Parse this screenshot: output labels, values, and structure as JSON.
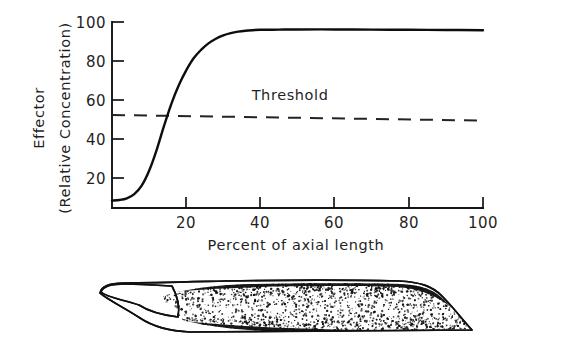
{
  "figure": {
    "name": "effector-gradient-figure",
    "background_color": "#ffffff",
    "ink_color": "#141414"
  },
  "chart_data": {
    "type": "line",
    "title": "",
    "subtitle": "",
    "xlabel": "Percent of axial length",
    "ylabel_line1": "Effector",
    "ylabel_line2": "(Relative Concentration)",
    "xlim": [
      0,
      100
    ],
    "ylim": [
      0,
      100
    ],
    "grid": false,
    "legend_position": "none",
    "xticks": [
      20,
      40,
      60,
      80,
      100
    ],
    "xtick_labels": [
      "20",
      "40",
      "60",
      "80",
      "100"
    ],
    "yticks": [
      20,
      40,
      60,
      80,
      100
    ],
    "ytick_labels": [
      "20",
      "40",
      "60",
      "80",
      "100"
    ],
    "series": [
      {
        "name": "Effector concentration",
        "style": "solid",
        "x": [
          0,
          2,
          4,
          6,
          8,
          10,
          12,
          14,
          16,
          18,
          20,
          22,
          24,
          26,
          28,
          30,
          32,
          34,
          36,
          38,
          40,
          45,
          50,
          60,
          70,
          80,
          90,
          100
        ],
        "values": [
          4,
          4.3,
          5.2,
          7.5,
          12,
          20,
          31,
          44,
          56,
          66,
          74,
          80.5,
          85,
          88.5,
          91,
          92.8,
          94,
          94.8,
          95.3,
          95.6,
          95.8,
          95.9,
          96,
          96,
          95.9,
          95.8,
          95.7,
          95.6
        ]
      },
      {
        "name": "Threshold",
        "style": "dashed",
        "x": [
          0,
          100
        ],
        "values": [
          50,
          47
        ]
      }
    ],
    "annotations": [
      {
        "text": "Threshold",
        "x": 48,
        "y": 58
      }
    ]
  },
  "diagram": {
    "name": "stippled-organism-schematic",
    "caption": ""
  }
}
